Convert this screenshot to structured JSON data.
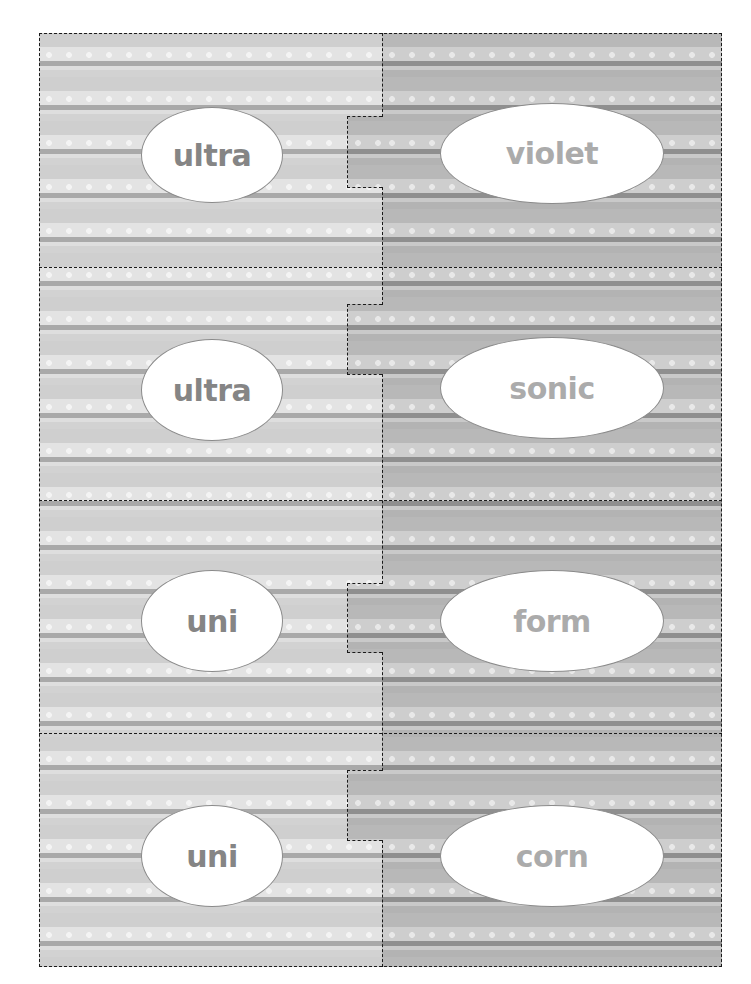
{
  "worksheet": {
    "title": "Prefix and root word puzzle cards",
    "colors": {
      "left_text": "#858585",
      "right_text": "#ababab",
      "cut_line": "#1a1a1a",
      "oval_fill": "#ffffff"
    },
    "rows": [
      {
        "prefix": "ultra",
        "root": "violet"
      },
      {
        "prefix": "ultra",
        "root": "sonic"
      },
      {
        "prefix": "uni",
        "root": "form"
      },
      {
        "prefix": "uni",
        "root": "corn"
      }
    ]
  }
}
